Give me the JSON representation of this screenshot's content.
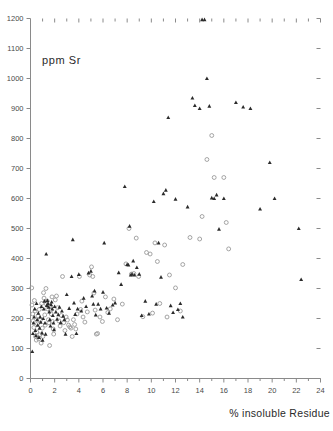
{
  "figure": {
    "background_color": "#ffffff",
    "frame_color": "#8a8a8a"
  },
  "labels": {
    "y_axis_title": "ppm Sr",
    "x_axis_title": "% insoluble Residue"
  },
  "chart_data": {
    "type": "scatter",
    "title": "",
    "xlabel": "% insoluble Residue",
    "ylabel": "ppm Sr",
    "xlim": [
      0,
      24
    ],
    "ylim": [
      0,
      1200
    ],
    "grid": false,
    "legend_position": "none",
    "x_ticks_major": [
      0,
      2,
      4,
      6,
      8,
      10,
      12,
      14,
      16,
      18,
      20,
      22,
      24
    ],
    "x_tick_labels": [
      "0",
      "2",
      "4",
      "6",
      "8",
      "10",
      "12",
      "14",
      "16",
      "18",
      "20",
      "22",
      "24"
    ],
    "x_ticks_minor": [
      1,
      3,
      5,
      7,
      9,
      11,
      13,
      15,
      17,
      19,
      21,
      23
    ],
    "y_ticks_major": [
      0,
      100,
      200,
      300,
      400,
      500,
      600,
      700,
      800,
      900,
      1000,
      1100,
      1200
    ],
    "y_tick_labels": [
      "0",
      "100",
      "200",
      "300",
      "400",
      "500",
      "600",
      "700",
      "800",
      "900",
      "1000",
      "1100",
      "1200"
    ],
    "axes_drawn": [
      "left",
      "bottom",
      "top-ticks",
      "right-ticks"
    ],
    "series": [
      {
        "name": "filled",
        "marker": "filled-triangle",
        "color": "#2b2b2b",
        "points": [
          [
            0.15,
            90
          ],
          [
            0.2,
            150
          ],
          [
            0.25,
            185
          ],
          [
            0.3,
            205
          ],
          [
            0.35,
            232
          ],
          [
            0.4,
            160
          ],
          [
            0.45,
            143
          ],
          [
            0.5,
            250
          ],
          [
            0.55,
            196
          ],
          [
            0.6,
            178
          ],
          [
            0.65,
            218
          ],
          [
            0.7,
            137
          ],
          [
            0.75,
            168
          ],
          [
            0.8,
            205
          ],
          [
            0.85,
            188
          ],
          [
            0.9,
            240
          ],
          [
            0.95,
            152
          ],
          [
            1.0,
            128
          ],
          [
            1.05,
            200
          ],
          [
            1.1,
            232
          ],
          [
            1.15,
            258
          ],
          [
            1.2,
            185
          ],
          [
            1.25,
            148
          ],
          [
            1.3,
            415
          ],
          [
            1.35,
            244
          ],
          [
            1.4,
            260
          ],
          [
            1.45,
            250
          ],
          [
            1.5,
            238
          ],
          [
            1.55,
            222
          ],
          [
            1.6,
            196
          ],
          [
            1.65,
            175
          ],
          [
            1.7,
            246
          ],
          [
            1.75,
            255
          ],
          [
            1.8,
            232
          ],
          [
            1.85,
            210
          ],
          [
            1.9,
            185
          ],
          [
            1.95,
            163
          ],
          [
            2.0,
            240
          ],
          [
            2.1,
            222
          ],
          [
            2.2,
            198
          ],
          [
            2.3,
            213
          ],
          [
            2.4,
            238
          ],
          [
            2.5,
            186
          ],
          [
            2.6,
            225
          ],
          [
            2.7,
            208
          ],
          [
            2.8,
            196
          ],
          [
            2.9,
            148
          ],
          [
            3.0,
            280
          ],
          [
            3.2,
            234
          ],
          [
            3.4,
            340
          ],
          [
            3.5,
            463
          ],
          [
            3.6,
            252
          ],
          [
            3.7,
            214
          ],
          [
            3.8,
            150
          ],
          [
            3.9,
            232
          ],
          [
            4.0,
            347
          ],
          [
            4.2,
            225
          ],
          [
            4.4,
            268
          ],
          [
            4.6,
            240
          ],
          [
            4.8,
            352
          ],
          [
            5.0,
            358
          ],
          [
            5.1,
            275
          ],
          [
            5.2,
            248
          ],
          [
            5.3,
            292
          ],
          [
            5.4,
            212
          ],
          [
            5.6,
            248
          ],
          [
            5.8,
            232
          ],
          [
            6.0,
            288
          ],
          [
            6.1,
            452
          ],
          [
            6.3,
            235
          ],
          [
            6.5,
            218
          ],
          [
            6.8,
            245
          ],
          [
            7.0,
            252
          ],
          [
            7.3,
            353
          ],
          [
            7.5,
            314
          ],
          [
            7.8,
            640
          ],
          [
            8.0,
            380
          ],
          [
            8.1,
            379
          ],
          [
            8.2,
            508
          ],
          [
            8.3,
            345
          ],
          [
            8.4,
            348
          ],
          [
            8.5,
            392
          ],
          [
            8.6,
            345
          ],
          [
            8.8,
            370
          ],
          [
            9.0,
            348
          ],
          [
            9.2,
            210
          ],
          [
            9.5,
            258
          ],
          [
            9.8,
            215
          ],
          [
            10.2,
            590
          ],
          [
            10.4,
            248
          ],
          [
            10.6,
            452
          ],
          [
            10.8,
            338
          ],
          [
            11.0,
            616
          ],
          [
            11.2,
            628
          ],
          [
            11.4,
            870
          ],
          [
            11.6,
            243
          ],
          [
            11.8,
            220
          ],
          [
            12.0,
            598
          ],
          [
            12.2,
            230
          ],
          [
            12.4,
            250
          ],
          [
            12.6,
            205
          ],
          [
            13.0,
            572
          ],
          [
            13.4,
            935
          ],
          [
            13.6,
            910
          ],
          [
            14.0,
            900
          ],
          [
            14.2,
            1196
          ],
          [
            14.4,
            1196
          ],
          [
            14.6,
            1000
          ],
          [
            14.8,
            908
          ],
          [
            15.0,
            602
          ],
          [
            15.2,
            600
          ],
          [
            15.4,
            612
          ],
          [
            15.6,
            498
          ],
          [
            16.0,
            600
          ],
          [
            17.0,
            920
          ],
          [
            17.6,
            905
          ],
          [
            18.2,
            900
          ],
          [
            19.0,
            565
          ],
          [
            19.8,
            720
          ],
          [
            20.2,
            600
          ],
          [
            22.2,
            500
          ],
          [
            22.4,
            330
          ]
        ]
      },
      {
        "name": "open",
        "marker": "open-circle",
        "color": "#9a9a9a",
        "points": [
          [
            0.1,
            302
          ],
          [
            0.12,
            245
          ],
          [
            0.18,
            215
          ],
          [
            0.22,
            192
          ],
          [
            0.28,
            170
          ],
          [
            0.32,
            260
          ],
          [
            0.38,
            225
          ],
          [
            0.42,
            140
          ],
          [
            0.48,
            128
          ],
          [
            0.52,
            155
          ],
          [
            0.58,
            182
          ],
          [
            0.62,
            208
          ],
          [
            0.68,
            132
          ],
          [
            0.72,
            230
          ],
          [
            0.78,
            146
          ],
          [
            0.82,
            195
          ],
          [
            0.88,
            118
          ],
          [
            0.92,
            250
          ],
          [
            0.98,
            168
          ],
          [
            1.02,
            140
          ],
          [
            1.08,
            286
          ],
          [
            1.12,
            268
          ],
          [
            1.18,
            212
          ],
          [
            1.22,
            178
          ],
          [
            1.28,
            300
          ],
          [
            1.32,
            248
          ],
          [
            1.38,
            258
          ],
          [
            1.42,
            232
          ],
          [
            1.48,
            196
          ],
          [
            1.52,
            186
          ],
          [
            1.58,
            110
          ],
          [
            1.62,
            242
          ],
          [
            1.68,
            228
          ],
          [
            1.72,
            215
          ],
          [
            1.78,
            272
          ],
          [
            1.82,
            190
          ],
          [
            1.88,
            165
          ],
          [
            1.92,
            148
          ],
          [
            2.05,
            262
          ],
          [
            2.15,
            275
          ],
          [
            2.25,
            236
          ],
          [
            2.35,
            192
          ],
          [
            2.45,
            175
          ],
          [
            2.55,
            210
          ],
          [
            2.65,
            340
          ],
          [
            2.75,
            186
          ],
          [
            2.85,
            160
          ],
          [
            2.95,
            205
          ],
          [
            3.05,
            195
          ],
          [
            3.15,
            178
          ],
          [
            3.25,
            172
          ],
          [
            3.35,
            168
          ],
          [
            3.45,
            140
          ],
          [
            3.55,
            196
          ],
          [
            3.65,
            180
          ],
          [
            3.75,
            165
          ],
          [
            3.85,
            215
          ],
          [
            4.05,
            340
          ],
          [
            4.15,
            230
          ],
          [
            4.25,
            258
          ],
          [
            4.35,
            205
          ],
          [
            4.5,
            188
          ],
          [
            4.7,
            222
          ],
          [
            4.9,
            345
          ],
          [
            5.05,
            372
          ],
          [
            5.15,
            340
          ],
          [
            5.25,
            285
          ],
          [
            5.35,
            228
          ],
          [
            5.45,
            148
          ],
          [
            5.55,
            150
          ],
          [
            5.75,
            205
          ],
          [
            5.95,
            190
          ],
          [
            6.2,
            272
          ],
          [
            6.4,
            220
          ],
          [
            6.6,
            232
          ],
          [
            6.9,
            265
          ],
          [
            7.2,
            196
          ],
          [
            7.6,
            248
          ],
          [
            7.9,
            382
          ],
          [
            8.15,
            500
          ],
          [
            8.35,
            348
          ],
          [
            8.55,
            350
          ],
          [
            8.75,
            468
          ],
          [
            8.95,
            340
          ],
          [
            9.3,
            206
          ],
          [
            9.6,
            420
          ],
          [
            9.9,
            415
          ],
          [
            10.1,
            218
          ],
          [
            10.3,
            452
          ],
          [
            10.5,
            390
          ],
          [
            10.7,
            250
          ],
          [
            11.1,
            445
          ],
          [
            11.3,
            205
          ],
          [
            11.5,
            345
          ],
          [
            12.0,
            302
          ],
          [
            12.4,
            225
          ],
          [
            12.6,
            380
          ],
          [
            13.2,
            470
          ],
          [
            14.0,
            465
          ],
          [
            14.2,
            540
          ],
          [
            14.6,
            730
          ],
          [
            15.0,
            810
          ],
          [
            15.2,
            670
          ],
          [
            16.0,
            670
          ],
          [
            16.2,
            520
          ],
          [
            16.4,
            432
          ]
        ]
      }
    ]
  }
}
